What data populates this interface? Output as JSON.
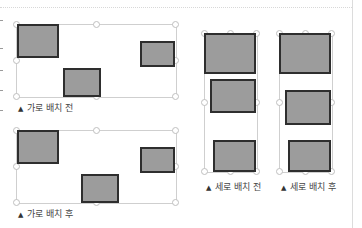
{
  "captions": {
    "horizontal_before": "가로 배치 전",
    "horizontal_after": "가로 배치 후",
    "vertical_before": "세로 배치 전",
    "vertical_after": "세로 배치 후"
  },
  "icons": {
    "caption_marker": "▲"
  },
  "colors": {
    "shape_fill": "#9c9c9c",
    "shape_border": "#2e2e2e",
    "frame_border": "#cfcfcf"
  }
}
